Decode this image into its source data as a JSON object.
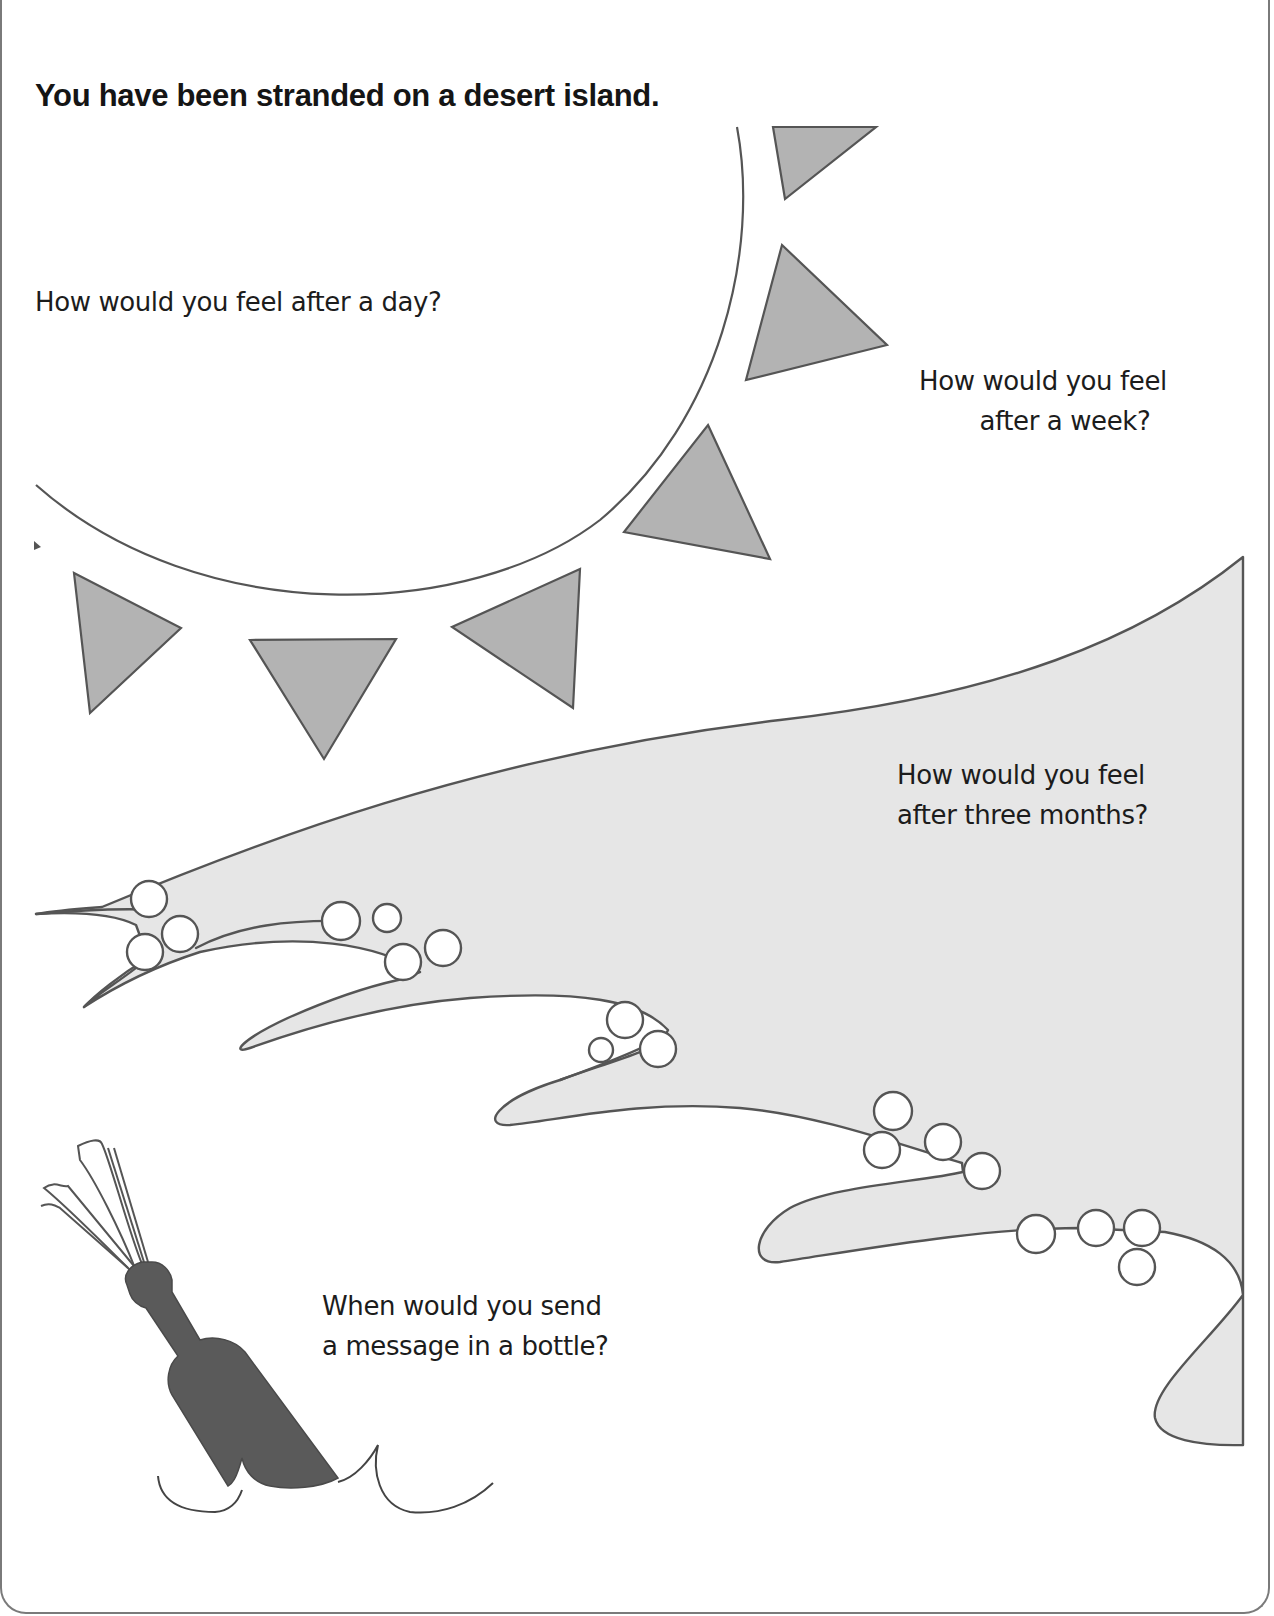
{
  "worksheet": {
    "title": "You have been stranded on a desert island.",
    "questions": [
      {
        "id": "after-a-day",
        "lines": [
          "How would you feel after a day?"
        ]
      },
      {
        "id": "after-a-week",
        "lines": [
          "How would you feel",
          "after a week?"
        ]
      },
      {
        "id": "after-three-months",
        "lines": [
          "How would you feel",
          "after three months?"
        ]
      },
      {
        "id": "message-in-bottle",
        "lines": [
          "When would you send",
          "a message in a bottle?"
        ]
      }
    ]
  },
  "illustrations": {
    "sun": {
      "icon": "sun-icon",
      "rays": 9,
      "ray_color": "#b3b3b3",
      "outline_color": "#555555"
    },
    "wave": {
      "icon": "wave-icon",
      "fill_color": "#e6e6e6",
      "outline_color": "#555555",
      "foam_bubbles": 24
    },
    "bottle": {
      "icon": "message-bottle-icon",
      "fill_color": "#5c5c5c"
    }
  },
  "colors": {
    "background": "#ffffff",
    "text": "#1c1c1c",
    "line": "#555555"
  }
}
